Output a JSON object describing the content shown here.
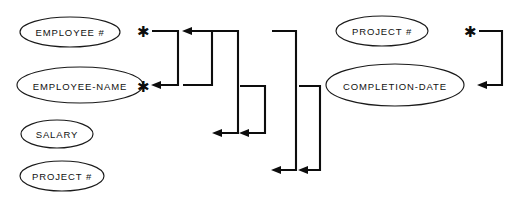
{
  "diagram": {
    "type": "bachman-functional-dependency",
    "background_color": "#ffffff",
    "line_color": "#0d0d0d",
    "text_color": "#111111",
    "entities": [
      {
        "id": "employee-number",
        "label": "EMPLOYEE #",
        "cx": 70,
        "cy": 32,
        "rx": 50,
        "ry": 15
      },
      {
        "id": "employee-name",
        "label": "EMPLOYEE-NAME",
        "cx": 80,
        "cy": 85,
        "rx": 63,
        "ry": 18
      },
      {
        "id": "salary",
        "label": "SALARY",
        "cx": 57,
        "cy": 134,
        "rx": 36,
        "ry": 14
      },
      {
        "id": "project-number-left",
        "label": "PROJECT #",
        "cx": 62,
        "cy": 176,
        "rx": 42,
        "ry": 15
      },
      {
        "id": "project-number-right",
        "label": "PROJECT #",
        "cx": 382,
        "cy": 31,
        "rx": 46,
        "ry": 15
      },
      {
        "id": "completion-date",
        "label": "COMPLETION-DATE",
        "cx": 395,
        "cy": 85,
        "rx": 69,
        "ry": 21
      }
    ],
    "markers": [
      {
        "id": "star-1",
        "glyph": "✱",
        "x": 143,
        "y": 31
      },
      {
        "id": "star-2",
        "glyph": "✱",
        "x": 143,
        "y": 86
      },
      {
        "id": "star-3",
        "glyph": "✱",
        "x": 470,
        "y": 31
      }
    ],
    "connectors": [
      {
        "id": "connector-1",
        "from_x": 152,
        "from_y": 31,
        "corner_x": 178,
        "to_x": 152,
        "to_y": 85,
        "arrow_at": "bottom-left"
      },
      {
        "id": "connector-2",
        "from_x": 183,
        "from_y": 85,
        "corner_x": 212,
        "to_x": 183,
        "to_y": 31,
        "arrow_at": "top-left"
      },
      {
        "id": "connector-3",
        "from_x": 213,
        "from_y": 31,
        "corner_x": 238,
        "to_x": 213,
        "to_y": 133,
        "arrow_at": "bottom-left"
      },
      {
        "id": "connector-4",
        "from_x": 240,
        "from_y": 86,
        "corner_x": 265,
        "to_x": 240,
        "to_y": 133,
        "arrow_at": "bottom-left"
      },
      {
        "id": "connector-5",
        "from_x": 272,
        "from_y": 31,
        "corner_x": 296,
        "to_x": 272,
        "to_y": 170,
        "arrow_at": "bottom-left"
      },
      {
        "id": "connector-6",
        "from_x": 299,
        "from_y": 86,
        "corner_x": 320,
        "to_x": 299,
        "to_y": 170,
        "arrow_at": "bottom-left"
      },
      {
        "id": "connector-7",
        "from_x": 479,
        "from_y": 31,
        "corner_x": 502,
        "to_x": 479,
        "to_y": 85,
        "arrow_at": "bottom-left"
      }
    ],
    "notes": {
      "asterisk_meaning": "*",
      "arrow_meaning": "functional dependency"
    }
  }
}
